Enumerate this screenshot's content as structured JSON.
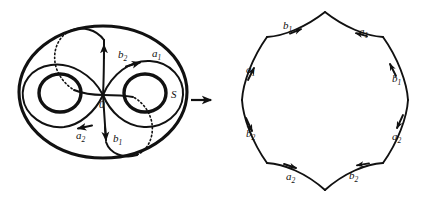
{
  "figure": {
    "caption_labels": {
      "surface_name": "S",
      "basepoint": "0"
    },
    "map_arrow": {
      "icon": "right-arrow-icon",
      "glyph": "→"
    },
    "surface": {
      "name": "S",
      "genus": 2,
      "basepoint_label": "0",
      "curve_labels": [
        {
          "id": "b2",
          "base": "b",
          "sub": "2",
          "x": 118,
          "y": 58
        },
        {
          "id": "a1",
          "base": "a",
          "sub": "1",
          "x": 152,
          "y": 57
        },
        {
          "id": "a2",
          "base": "a",
          "sub": "2",
          "x": 76,
          "y": 139
        },
        {
          "id": "b1",
          "base": "b",
          "sub": "1",
          "x": 113,
          "y": 142
        }
      ]
    },
    "polygon": {
      "type": "octagon",
      "description": "fundamental polygon with identified edges",
      "relator": "a1 b1 a1^-1 b1^-1 a2 b2 a2^-1 b2^-1",
      "edge_labels": [
        {
          "id": "edge-top-left",
          "base": "b",
          "sub": "1",
          "x": 283,
          "y": 29
        },
        {
          "id": "edge-top-right",
          "base": "a",
          "sub": "1",
          "x": 359,
          "y": 35
        },
        {
          "id": "edge-left-upper",
          "base": "a",
          "sub": "1",
          "x": 253,
          "y": 73
        },
        {
          "id": "edge-right-upper",
          "base": "b",
          "sub": "1",
          "x": 392,
          "y": 82
        },
        {
          "id": "edge-left-lower",
          "base": "b",
          "sub": "2",
          "x": 253,
          "y": 137
        },
        {
          "id": "edge-right-lower",
          "base": "a",
          "sub": "2",
          "x": 392,
          "y": 140
        },
        {
          "id": "edge-bottom-left",
          "base": "a",
          "sub": "2",
          "x": 291,
          "y": 179
        },
        {
          "id": "edge-bottom-right",
          "base": "b",
          "sub": "2",
          "x": 353,
          "y": 178
        }
      ]
    },
    "colors": {
      "ink": "#111111",
      "background": "#ffffff"
    }
  }
}
